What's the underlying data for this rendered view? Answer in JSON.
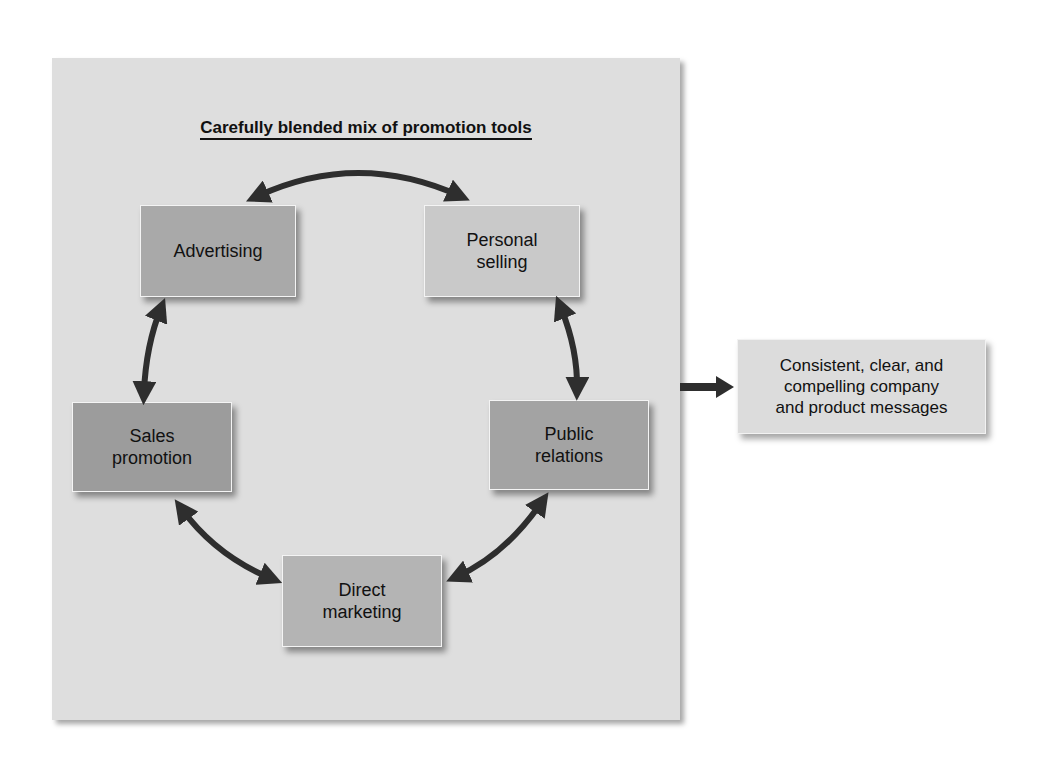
{
  "diagram": {
    "title": "Carefully blended mix of promotion tools",
    "tools": [
      {
        "label": "Advertising",
        "color": "#a9a9a9"
      },
      {
        "label": "Personal selling",
        "color": "#c9c9c9"
      },
      {
        "label": "Public relations",
        "color": "#a3a3a3"
      },
      {
        "label": "Direct marketing",
        "color": "#b4b4b4"
      },
      {
        "label": "Sales promotion",
        "color": "#9c9c9c"
      }
    ],
    "connections": [
      [
        "Advertising",
        "Personal selling"
      ],
      [
        "Personal selling",
        "Public relations"
      ],
      [
        "Public relations",
        "Direct marketing"
      ],
      [
        "Direct marketing",
        "Sales promotion"
      ],
      [
        "Sales promotion",
        "Advertising"
      ]
    ],
    "output": {
      "label": "Consistent, clear, and compelling company and product messages",
      "line1": "Consistent, clear, and",
      "line2": "compelling company",
      "line3": "and product messages"
    },
    "colors": {
      "panel": "#dedede",
      "arrow": "#2e2e2e",
      "output_box": "#dcdcdc"
    }
  }
}
